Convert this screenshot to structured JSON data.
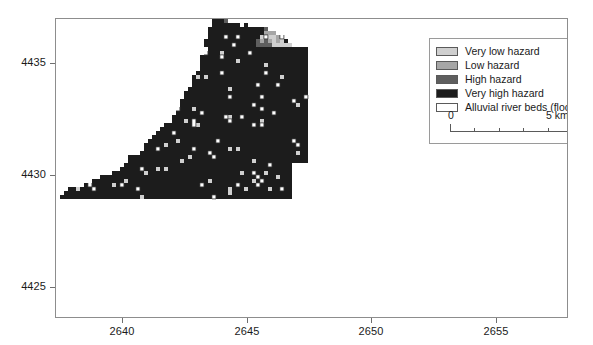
{
  "figure": {
    "type": "raster-hazard-map",
    "background_color": "#ffffff",
    "frame_color": "#8d8d8d"
  },
  "axes": {
    "x": {
      "label": "",
      "tick_labels": [
        "2640",
        "2645",
        "2650",
        "2655"
      ],
      "tick_values": [
        2640,
        2645,
        2650,
        2655
      ],
      "range": [
        2637.3,
        2657.9
      ],
      "units": "km (UTM easting)"
    },
    "y": {
      "label": "",
      "tick_labels": [
        "4435",
        "4430",
        "4425"
      ],
      "tick_values": [
        4435,
        4430,
        4425
      ],
      "range": [
        4423.6,
        4437.0
      ],
      "units": "km (UTM northing)"
    }
  },
  "legend": {
    "items": [
      {
        "label": "Very low hazard",
        "color": "#cfcfcf",
        "class_id": 1
      },
      {
        "label": "Low hazard",
        "color": "#a6a6a6",
        "class_id": 2
      },
      {
        "label": "High hazard",
        "color": "#5e5e5e",
        "class_id": 3
      },
      {
        "label": "Very high hazard",
        "color": "#1c1c1c",
        "class_id": 4
      },
      {
        "label": "Alluvial river beds (flooding hazard)",
        "color": "#ffffff",
        "class_id": 5
      }
    ],
    "border_color": "#9a9a9a"
  },
  "scalebar": {
    "zero_label": "0",
    "max_label": "5 km",
    "length_km": 5,
    "segments": 5,
    "tick_color": "#5a5a5a"
  },
  "chart_data": {
    "type": "heatmap",
    "title": "",
    "xlabel": "",
    "ylabel": "",
    "categories": [
      "Very low hazard",
      "Low hazard",
      "High hazard",
      "Very high hazard",
      "Alluvial river beds (flooding hazard)"
    ],
    "class_colors": [
      "#cfcfcf",
      "#a6a6a6",
      "#5e5e5e",
      "#1c1c1c",
      "#ffffff"
    ],
    "xlim": [
      2637.3,
      2657.9
    ],
    "ylim": [
      4423.6,
      4437.0
    ],
    "grid": false,
    "legend_position": "top-right",
    "cell_size_px": 4,
    "seed": 20240517,
    "catchment": {
      "description": "Triangular mountain catchment draining to a long valley tail toward the south-east",
      "outline_norm": [
        [
          0.305,
          0.0
        ],
        [
          0.35,
          0.012
        ],
        [
          0.395,
          0.03
        ],
        [
          0.44,
          0.055
        ],
        [
          0.47,
          0.09
        ],
        [
          0.52,
          0.12
        ],
        [
          0.56,
          0.16
        ],
        [
          0.6,
          0.21
        ],
        [
          0.64,
          0.27
        ],
        [
          0.672,
          0.33
        ],
        [
          0.7,
          0.39
        ],
        [
          0.73,
          0.45
        ],
        [
          0.76,
          0.51
        ],
        [
          0.8,
          0.56
        ],
        [
          0.84,
          0.6
        ],
        [
          0.88,
          0.63
        ],
        [
          0.92,
          0.66
        ],
        [
          0.952,
          0.7
        ],
        [
          0.975,
          0.745
        ],
        [
          0.99,
          0.79
        ],
        [
          0.998,
          0.84
        ],
        [
          0.998,
          0.9
        ],
        [
          0.985,
          0.93
        ],
        [
          0.95,
          0.94
        ],
        [
          0.9,
          0.93
        ],
        [
          0.85,
          0.905
        ],
        [
          0.8,
          0.88
        ],
        [
          0.75,
          0.862
        ],
        [
          0.7,
          0.855
        ],
        [
          0.65,
          0.87
        ],
        [
          0.6,
          0.905
        ],
        [
          0.56,
          0.955
        ],
        [
          0.53,
          0.995
        ],
        [
          0.48,
          1.0
        ],
        [
          0.44,
          0.985
        ],
        [
          0.4,
          0.96
        ],
        [
          0.36,
          0.94
        ],
        [
          0.32,
          0.93
        ],
        [
          0.28,
          0.925
        ],
        [
          0.24,
          0.91
        ],
        [
          0.2,
          0.88
        ],
        [
          0.16,
          0.84
        ],
        [
          0.12,
          0.8
        ],
        [
          0.085,
          0.76
        ],
        [
          0.055,
          0.72
        ],
        [
          0.03,
          0.68
        ],
        [
          0.012,
          0.645
        ],
        [
          0.004,
          0.61
        ],
        [
          0.01,
          0.585
        ],
        [
          0.035,
          0.565
        ],
        [
          0.07,
          0.545
        ],
        [
          0.105,
          0.515
        ],
        [
          0.14,
          0.475
        ],
        [
          0.175,
          0.425
        ],
        [
          0.21,
          0.36
        ],
        [
          0.24,
          0.29
        ],
        [
          0.265,
          0.215
        ],
        [
          0.285,
          0.14
        ],
        [
          0.296,
          0.07
        ]
      ],
      "rivers": [
        {
          "name": "main-channel",
          "points_norm": [
            [
              0.455,
              0.12
            ],
            [
              0.462,
              0.18
            ],
            [
              0.47,
              0.235
            ],
            [
              0.482,
              0.285
            ],
            [
              0.5,
              0.33
            ],
            [
              0.525,
              0.37
            ],
            [
              0.552,
              0.405
            ],
            [
              0.578,
              0.44
            ],
            [
              0.6,
              0.48
            ],
            [
              0.618,
              0.52
            ],
            [
              0.632,
              0.56
            ],
            [
              0.645,
              0.6
            ],
            [
              0.652,
              0.64
            ],
            [
              0.655,
              0.68
            ],
            [
              0.67,
              0.715
            ],
            [
              0.7,
              0.745
            ],
            [
              0.74,
              0.775
            ],
            [
              0.785,
              0.805
            ],
            [
              0.83,
              0.835
            ],
            [
              0.875,
              0.862
            ],
            [
              0.915,
              0.885
            ],
            [
              0.955,
              0.905
            ],
            [
              0.99,
              0.918
            ]
          ],
          "width_cells": 2
        },
        {
          "name": "west-tributary",
          "points_norm": [
            [
              0.19,
              0.6
            ],
            [
              0.23,
              0.575
            ],
            [
              0.275,
              0.545
            ],
            [
              0.32,
              0.51
            ],
            [
              0.365,
              0.475
            ],
            [
              0.408,
              0.44
            ],
            [
              0.45,
              0.41
            ],
            [
              0.49,
              0.388
            ],
            [
              0.525,
              0.372
            ]
          ],
          "width_cells": 2
        },
        {
          "name": "lower-tail-channel",
          "points_norm": [
            [
              0.64,
              0.7
            ],
            [
              0.68,
              0.73
            ],
            [
              0.72,
              0.762
            ],
            [
              0.762,
              0.792
            ],
            [
              0.805,
              0.822
            ],
            [
              0.848,
              0.85
            ],
            [
              0.89,
              0.875
            ],
            [
              0.93,
              0.898
            ],
            [
              0.97,
              0.915
            ]
          ],
          "width_cells": 2
        }
      ],
      "valley_floor": {
        "description": "Very-low / low hazard apron following the valley floors",
        "halo_cells": 3
      }
    },
    "class_fractions": {
      "very_low_hazard": 0.14,
      "low_hazard": 0.31,
      "high_hazard": 0.27,
      "very_high_hazard": 0.24,
      "alluvial_river_beds": 0.04
    }
  }
}
